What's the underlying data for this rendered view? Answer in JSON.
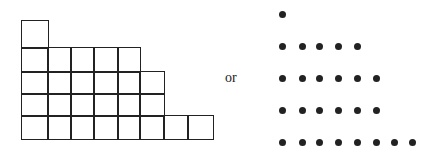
{
  "figure": {
    "connector_text": "or",
    "partition": [
      1,
      5,
      6,
      6,
      8
    ],
    "young_diagram": {
      "rows": [
        1,
        5,
        6,
        6,
        8
      ],
      "col_x": [
        21,
        47,
        70,
        93,
        117,
        139,
        163,
        187,
        212
      ],
      "row_y": [
        20,
        47,
        71,
        93,
        115,
        138
      ]
    },
    "ferrers_diagram": {
      "rows": [
        1,
        5,
        6,
        6,
        8
      ],
      "dot_x": [
        282,
        302,
        319,
        338,
        357,
        376,
        394,
        412
      ],
      "dot_y": [
        14,
        46,
        78,
        110,
        142
      ]
    },
    "colors": {
      "ink": "#222222",
      "background": "#ffffff"
    }
  }
}
